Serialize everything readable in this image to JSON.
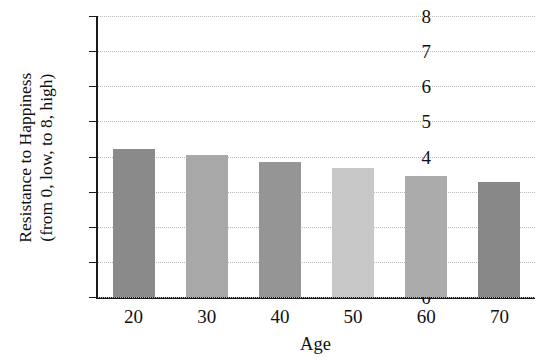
{
  "chart_data": {
    "type": "bar",
    "title": "",
    "xlabel": "Age",
    "ylabel": "Resistance to Happiness (from 0, low, to 8, high)",
    "ylabel_lines": [
      "Resistance to Happiness",
      "(from 0, low, to 8, high)"
    ],
    "categories": [
      "20",
      "30",
      "40",
      "50",
      "60",
      "70"
    ],
    "values": [
      4.22,
      4.05,
      3.85,
      3.67,
      3.45,
      3.28
    ],
    "ylim": [
      0,
      8
    ],
    "yticks": [
      "8",
      "7",
      "6",
      "5",
      "4",
      "3",
      "2",
      "1",
      "0"
    ],
    "ytick_values": [
      8,
      7,
      6,
      5,
      4,
      3,
      2,
      1,
      0
    ],
    "grid": true,
    "grid_style": "dotted",
    "legend": "none",
    "bar_colors": [
      "#8a8a8a",
      "#a8a8a8",
      "#959595",
      "#c8c8c8",
      "#ababab",
      "#888888"
    ],
    "grid_color": "#b9b9b9",
    "axis_color": "#1a1a1a",
    "background": "#ffffff"
  }
}
